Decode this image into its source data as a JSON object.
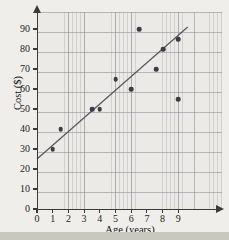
{
  "chart_data": {
    "type": "scatter",
    "title": "",
    "xlabel": "Age (years)",
    "ylabel": "Cost ($)",
    "xlim": [
      0,
      9.8
    ],
    "ylim": [
      0,
      95
    ],
    "grid": true,
    "legend": "none",
    "xticks": [
      0,
      1,
      2,
      3,
      4,
      5,
      6,
      7,
      8,
      9
    ],
    "xtick_labels": [
      "0",
      "1",
      "2",
      "3",
      "4",
      "5",
      "6",
      "7",
      "8",
      "9"
    ],
    "yticks": [
      0,
      10,
      20,
      30,
      40,
      50,
      60,
      70,
      80,
      90
    ],
    "ytick_labels": [
      "0",
      "10",
      "20",
      "30",
      "40",
      "50",
      "60",
      "70",
      "80",
      "90"
    ],
    "point_color": "#3c3c44",
    "line_color": "#55555e",
    "axis_color": "#3a3a3a",
    "background": "#efeeea",
    "points": [
      {
        "x": 1.0,
        "y": 30
      },
      {
        "x": 1.5,
        "y": 40
      },
      {
        "x": 3.5,
        "y": 50
      },
      {
        "x": 4.0,
        "y": 50
      },
      {
        "x": 5.0,
        "y": 65
      },
      {
        "x": 6.0,
        "y": 60
      },
      {
        "x": 6.5,
        "y": 90
      },
      {
        "x": 7.6,
        "y": 70
      },
      {
        "x": 8.05,
        "y": 80
      },
      {
        "x": 9.0,
        "y": 85
      },
      {
        "x": 9.0,
        "y": 55
      }
    ],
    "trend_line": {
      "label": "line of best fit",
      "x_start": 0.0,
      "y_start": 25,
      "x_end": 9.6,
      "y_end": 91
    }
  }
}
